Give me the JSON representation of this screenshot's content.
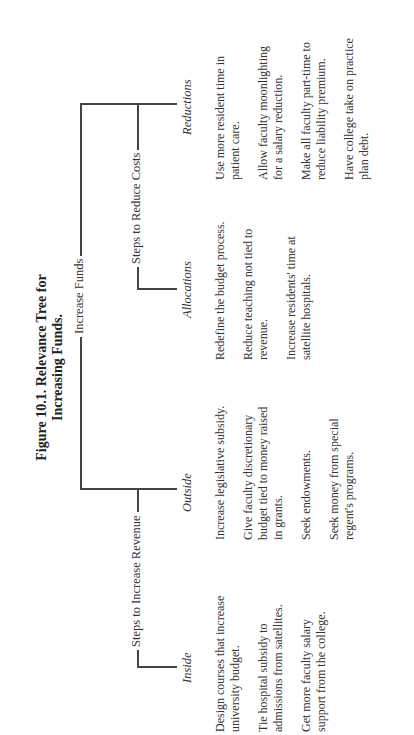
{
  "figure": {
    "title_line1": "Figure 10.1. Relevance Tree for",
    "title_line2": "Increasing Funds."
  },
  "tree": {
    "root": "Increase Funds",
    "branches": [
      {
        "label": "Steps to Increase Revenue",
        "children": [
          {
            "label": "Inside",
            "items": [
              "Design courses that increase university budget.",
              "Tie hospital subsidy to admissions from satellites.",
              "Get more faculty salary support from the college."
            ]
          },
          {
            "label": "Outside",
            "items": [
              "Increase legislative subsidy.",
              "Give faculty discretionary budget tied to money raised in grants.",
              "Seek endowments.",
              "Seek money from special regent's programs."
            ]
          }
        ]
      },
      {
        "label": "Steps to Reduce Costs",
        "children": [
          {
            "label": "Allocations",
            "items": [
              "Redefine the budget process.",
              "Reduce teaching not tied to revenue.",
              "Increase residents' time at satellite hospitals."
            ]
          },
          {
            "label": "Reductions",
            "items": [
              "Use more resident time in patient care.",
              "Allow faculty moonlighting for a salary reduction.",
              "Make all faculty part-time to reduce liability premium.",
              "Have college take on practice plan debt."
            ]
          }
        ]
      }
    ]
  }
}
